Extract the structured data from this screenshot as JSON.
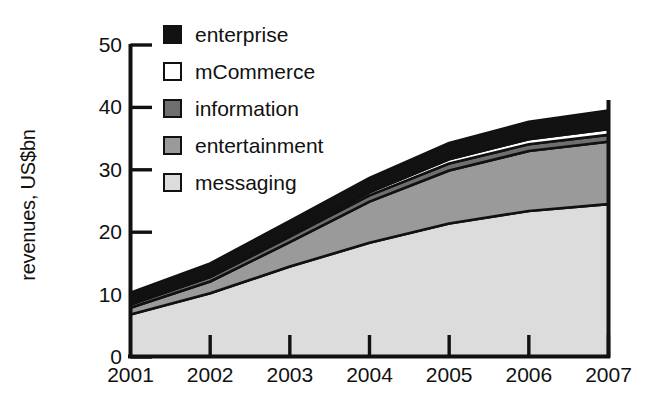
{
  "chart_data": {
    "type": "area",
    "title": "",
    "subtitle": "",
    "xlabel": "",
    "ylabel": "revenues, US$bn",
    "x": [
      2001,
      2002,
      2003,
      2004,
      2005,
      2006,
      2007
    ],
    "categories": [
      "2001",
      "2002",
      "2003",
      "2004",
      "2005",
      "2006",
      "2007"
    ],
    "xlim": [
      2001,
      2007
    ],
    "ylim": [
      0,
      50
    ],
    "ytick_values": [
      0,
      10,
      20,
      30,
      40,
      50
    ],
    "ytick_labels": [
      "0",
      "10",
      "20",
      "30",
      "40",
      "50"
    ],
    "xtick_labels": [
      "2001",
      "2002",
      "2003",
      "2004",
      "2005",
      "2006",
      "2007"
    ],
    "grid": false,
    "stacked": true,
    "stack_order_bottom_to_top": [
      "messaging",
      "entertainment",
      "information",
      "mCommerce",
      "enterprise"
    ],
    "legend_position": "top-left-inside",
    "series": [
      {
        "name": "messaging",
        "color": "#dcdcdc",
        "values": [
          6.8,
          10.2,
          14.5,
          18.3,
          21.4,
          23.4,
          24.5
        ]
      },
      {
        "name": "entertainment",
        "color": "#9a9a9a",
        "values": [
          1.1,
          1.9,
          3.9,
          6.6,
          8.5,
          9.6,
          10.0
        ]
      },
      {
        "name": "information",
        "color": "#6e6e6e",
        "values": [
          0.5,
          0.7,
          0.9,
          1.0,
          1.1,
          1.1,
          1.1
        ]
      },
      {
        "name": "mCommerce",
        "color": "#ffffff",
        "values": [
          0.2,
          0.3,
          0.4,
          0.5,
          0.7,
          0.8,
          0.9
        ]
      },
      {
        "name": "enterprise",
        "color": "#121212",
        "values": [
          1.7,
          1.9,
          2.1,
          2.3,
          2.6,
          2.8,
          3.0
        ]
      }
    ],
    "cumulative_totals": [
      10.3,
      15.0,
      21.8,
      28.7,
      34.3,
      37.7,
      39.5
    ],
    "stack_boundaries": {
      "note": "cumulative upper edge of each band, bottom to top, per year",
      "messaging": [
        6.8,
        10.2,
        14.5,
        18.3,
        21.4,
        23.4,
        24.5
      ],
      "entertainment": [
        7.9,
        12.1,
        18.4,
        24.9,
        29.9,
        33.0,
        34.5
      ],
      "information": [
        8.4,
        12.8,
        19.3,
        25.9,
        31.0,
        34.1,
        35.6
      ],
      "mCommerce": [
        8.6,
        13.1,
        19.7,
        26.4,
        31.7,
        34.9,
        36.5
      ],
      "enterprise": [
        10.3,
        15.0,
        21.8,
        28.7,
        34.3,
        37.7,
        39.5
      ]
    }
  },
  "legend": {
    "items": [
      {
        "label": "enterprise",
        "swatch": "#121212"
      },
      {
        "label": "mCommerce",
        "swatch": "#ffffff"
      },
      {
        "label": "information",
        "swatch": "#6e6e6e"
      },
      {
        "label": "entertainment",
        "swatch": "#9a9a9a"
      },
      {
        "label": "messaging",
        "swatch": "#dcdcdc"
      }
    ]
  },
  "axes": {
    "y_title": "revenues, US$bn",
    "y_ticks": [
      "50",
      "40",
      "30",
      "20",
      "10",
      "0"
    ],
    "x_ticks": [
      "2001",
      "2002",
      "2003",
      "2004",
      "2005",
      "2006",
      "2007"
    ]
  },
  "colors": {
    "axis": "#111111",
    "background": "#ffffff",
    "enterprise": "#121212",
    "mCommerce": "#ffffff",
    "information": "#6e6e6e",
    "entertainment": "#9a9a9a",
    "messaging": "#dcdcdc"
  }
}
